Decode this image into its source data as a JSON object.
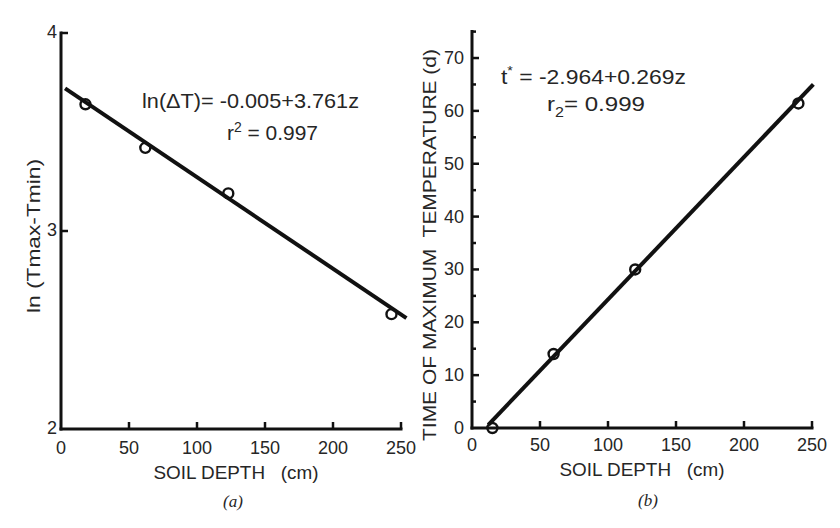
{
  "figure": {
    "background": "#ffffff",
    "ink_color": "#111111",
    "text_color": "#262626"
  },
  "chart_data": [
    {
      "panel": "a",
      "type": "scatter",
      "caption": "(a)",
      "title": "",
      "xlabel": "SOIL DEPTH   (cm)",
      "ylabel": "ln (Tmax-Tmin)",
      "xlim": [
        0,
        250
      ],
      "ylim": [
        2,
        4
      ],
      "xticks": [
        0,
        50,
        100,
        150,
        200,
        250
      ],
      "yticks": [
        2,
        3,
        4
      ],
      "grid": false,
      "legend": null,
      "series": [
        {
          "name": "observed",
          "marker": "open-circle",
          "x": [
            18,
            62,
            123,
            243
          ],
          "y": [
            3.64,
            3.42,
            3.19,
            2.58
          ]
        }
      ],
      "fit_line": {
        "x": [
          3,
          254
        ],
        "y": [
          3.72,
          2.56
        ]
      },
      "annotations": {
        "equation": {
          "text": "ln(ΔT)= -0.005+3.761z"
        },
        "fit_stat": {
          "base": "r",
          "script": "2",
          "script_type": "superscript",
          "value": " = 0.997"
        }
      }
    },
    {
      "panel": "b",
      "type": "scatter",
      "caption": "(b)",
      "title": "",
      "xlabel": "SOIL DEPTH   (cm)",
      "ylabel": "TIME OF MAXIMUM  TEMPERATURE (d)",
      "xlim": [
        0,
        250
      ],
      "ylim": [
        0,
        75
      ],
      "xticks": [
        0,
        50,
        100,
        150,
        200,
        250
      ],
      "yticks": [
        0,
        10,
        20,
        30,
        40,
        50,
        60,
        70
      ],
      "yminor_step": 5,
      "grid": false,
      "legend": null,
      "series": [
        {
          "name": "observed",
          "marker": "open-circle",
          "x": [
            15,
            60,
            120,
            240
          ],
          "y": [
            0,
            14,
            30,
            61.4
          ]
        }
      ],
      "fit_line": {
        "x": [
          12,
          251
        ],
        "y": [
          0.6,
          65
        ]
      },
      "annotations": {
        "equation": {
          "base": "t",
          "script": "*",
          "script_type": "superscript",
          "rest": " = -2.964+0.269z"
        },
        "fit_stat": {
          "base": "r",
          "script": "2",
          "script_type": "subscript",
          "value": "= 0.999"
        }
      }
    }
  ]
}
